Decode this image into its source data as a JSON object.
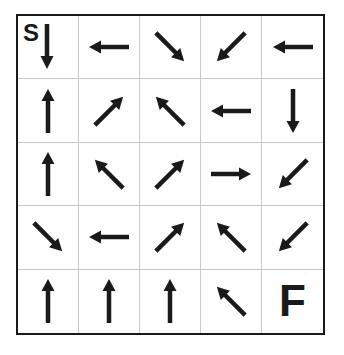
{
  "puzzle": {
    "type": "arrow-maze",
    "rows": 5,
    "cols": 5,
    "start_label": "S",
    "finish_label": "F",
    "colors": {
      "ink": "#1a1a1a",
      "grid_line": "#c8c8c8",
      "border": "#1a1a1a",
      "background": "#ffffff"
    },
    "grid": [
      [
        "S:down",
        "left",
        "down-right",
        "down-left",
        "left"
      ],
      [
        "up",
        "up-right",
        "up-left",
        "left",
        "down"
      ],
      [
        "up",
        "up-left",
        "up-right",
        "right",
        "down-left"
      ],
      [
        "down-right",
        "left",
        "up-right",
        "up-left",
        "down-left"
      ],
      [
        "up",
        "up",
        "up",
        "up-left",
        "F"
      ]
    ]
  }
}
